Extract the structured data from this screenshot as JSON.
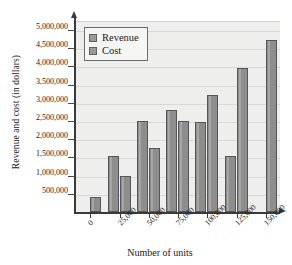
{
  "chart_data": {
    "type": "bar",
    "title": "",
    "xlabel": "Number of units",
    "ylabel": "Revenue and cost (in dollars)",
    "categories": [
      "0",
      "25,000",
      "50,000",
      "75,000",
      "100,000",
      "125,000",
      "150,000"
    ],
    "series": [
      {
        "name": "Revenue",
        "values": [
          null,
          1550000,
          2500000,
          2800000,
          2480000,
          1540000,
          null
        ]
      },
      {
        "name": "Cost",
        "values": [
          400000,
          1000000,
          1750000,
          2490000,
          3220000,
          3970000,
          4720000
        ]
      }
    ],
    "ylim": [
      0,
      5250000
    ],
    "y_ticks": [
      "500,000",
      "1,000,000",
      "1,500,000",
      "2,000,000",
      "2,500,000",
      "3,000,000",
      "3,500,000",
      "4,000,000",
      "4,500,000",
      "5,000,000"
    ],
    "y_tick_values": [
      500000,
      1000000,
      1500000,
      2000000,
      2500000,
      3000000,
      3500000,
      4000000,
      4500000,
      5000000
    ],
    "grid": true,
    "legend_position": "top-left",
    "colors": {
      "bar_fill": "#8d8d8d",
      "bar_border": "#55555a",
      "plot_background": "#eeeeec",
      "gridline": "#d8d8d4",
      "axis": "#3a3a3a",
      "legend_background": "#f6f6f4",
      "legend_border": "#6d6d6d",
      "text": "#1a1a1a"
    }
  },
  "legend": {
    "items": [
      {
        "label": "Revenue"
      },
      {
        "label": "Cost"
      }
    ]
  }
}
